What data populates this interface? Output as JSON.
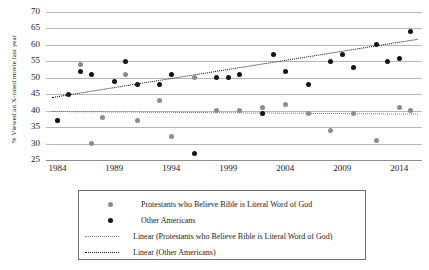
{
  "chart_data": {
    "type": "scatter",
    "title": "",
    "xlabel": "",
    "ylabel": "% Viewed an X-rated movie last year",
    "xlim": [
      1983,
      2016
    ],
    "ylim": [
      25,
      70
    ],
    "ytick_step": 5,
    "grid": true,
    "legend_position": "bottom",
    "xticks": [
      "1984",
      "1989",
      "1994",
      "1999",
      "2004",
      "2009",
      "2014"
    ],
    "ytick_labels": [
      "70",
      "65",
      "60",
      "55",
      "50",
      "45",
      "40",
      "35",
      "30",
      "25"
    ],
    "ytick_values": [
      70,
      65,
      60,
      55,
      50,
      45,
      40,
      35,
      30,
      25
    ],
    "series": [
      {
        "name": "Protestants who Believe Bible is Literal Word of God",
        "marker": "circle",
        "color": "#8d8d8d",
        "points": [
          {
            "x": 1984,
            "y": 37
          },
          {
            "x": 1986,
            "y": 54
          },
          {
            "x": 1987,
            "y": 30
          },
          {
            "x": 1988,
            "y": 38
          },
          {
            "x": 1990,
            "y": 51
          },
          {
            "x": 1991,
            "y": 37
          },
          {
            "x": 1993,
            "y": 43
          },
          {
            "x": 1994,
            "y": 32
          },
          {
            "x": 1996,
            "y": 50
          },
          {
            "x": 1998,
            "y": 40
          },
          {
            "x": 2000,
            "y": 40
          },
          {
            "x": 2002,
            "y": 41
          },
          {
            "x": 2004,
            "y": 42
          },
          {
            "x": 2006,
            "y": 39
          },
          {
            "x": 2008,
            "y": 34
          },
          {
            "x": 2010,
            "y": 39
          },
          {
            "x": 2012,
            "y": 31
          },
          {
            "x": 2014,
            "y": 41
          },
          {
            "x": 2015,
            "y": 40
          }
        ]
      },
      {
        "name": "Other Americans",
        "marker": "circle",
        "color": "#141414",
        "points": [
          {
            "x": 1984,
            "y": 37
          },
          {
            "x": 1985,
            "y": 45
          },
          {
            "x": 1986,
            "y": 52
          },
          {
            "x": 1987,
            "y": 51
          },
          {
            "x": 1989,
            "y": 49
          },
          {
            "x": 1990,
            "y": 55
          },
          {
            "x": 1991,
            "y": 48
          },
          {
            "x": 1993,
            "y": 48
          },
          {
            "x": 1994,
            "y": 51
          },
          {
            "x": 1996,
            "y": 27
          },
          {
            "x": 1998,
            "y": 50
          },
          {
            "x": 1999,
            "y": 50
          },
          {
            "x": 2000,
            "y": 51
          },
          {
            "x": 2002,
            "y": 39
          },
          {
            "x": 2003,
            "y": 57
          },
          {
            "x": 2004,
            "y": 52
          },
          {
            "x": 2006,
            "y": 48
          },
          {
            "x": 2008,
            "y": 55
          },
          {
            "x": 2009,
            "y": 57
          },
          {
            "x": 2010,
            "y": 53
          },
          {
            "x": 2012,
            "y": 60
          },
          {
            "x": 2013,
            "y": 55
          },
          {
            "x": 2014,
            "y": 56
          },
          {
            "x": 2015,
            "y": 64
          }
        ]
      }
    ],
    "trendlines": [
      {
        "name": "Linear (Protestants who Believe Bible is Literal Word of God)",
        "color": "#777777",
        "style": "dotted",
        "x0": 1983.5,
        "y0": 40.0,
        "x1": 2015.6,
        "y1": 39.2
      },
      {
        "name": "Linear (Other Americans)",
        "color": "#111111",
        "style": "dotted",
        "x0": 1983.5,
        "y0": 44.3,
        "x1": 2015.6,
        "y1": 62.0
      }
    ]
  },
  "legend": {
    "entries": [
      {
        "type": "marker",
        "series": 0,
        "label": "Protestants who Believe Bible is Literal Word of God"
      },
      {
        "type": "marker",
        "series": 1,
        "label": "Other Americans"
      },
      {
        "type": "line",
        "series": 0,
        "label": "Linear (Protestants who Believe Bible is Literal Word of God)"
      },
      {
        "type": "line",
        "series": 1,
        "label": "Linear (Other Americans)"
      }
    ]
  }
}
